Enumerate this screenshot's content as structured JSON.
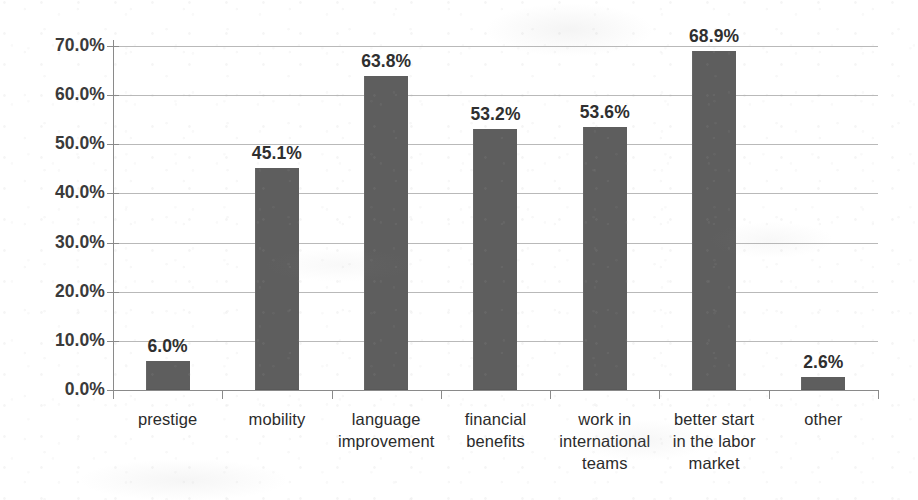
{
  "chart_data": {
    "type": "bar",
    "title": "",
    "subtitle": "",
    "xlabel": "",
    "ylabel": "",
    "grid": true,
    "legend": false,
    "legend_position": "none",
    "ylim": [
      0,
      70
    ],
    "y_tick_step": 10,
    "value_suffix": "%",
    "bar_color": "#5e5e5e",
    "gridline_color": "#b9b9b9",
    "axis_color": "#8a8a8a",
    "label_color": "#2f2f2f",
    "categories": [
      "prestige",
      "mobility",
      "language improvement",
      "financial benefits",
      "work in international teams",
      "better start in the labor market",
      "other"
    ],
    "category_lines": [
      [
        "prestige"
      ],
      [
        "mobility"
      ],
      [
        "language",
        "improvement"
      ],
      [
        "financial",
        "benefits"
      ],
      [
        "work in",
        "international",
        "teams"
      ],
      [
        "better start",
        "in the labor",
        "market"
      ],
      [
        "other"
      ]
    ],
    "values": [
      6.0,
      45.1,
      63.8,
      53.2,
      53.6,
      68.9,
      2.6
    ],
    "data_labels": [
      "6.0%",
      "45.1%",
      "63.8%",
      "53.2%",
      "53.6%",
      "68.9%",
      "2.6%"
    ],
    "y_ticks": [
      0,
      10,
      20,
      30,
      40,
      50,
      60,
      70
    ],
    "y_tick_labels": [
      "0.0%",
      "10.0%",
      "20.0%",
      "30.0%",
      "40.0%",
      "50.0%",
      "60.0%",
      "70.0%"
    ]
  }
}
